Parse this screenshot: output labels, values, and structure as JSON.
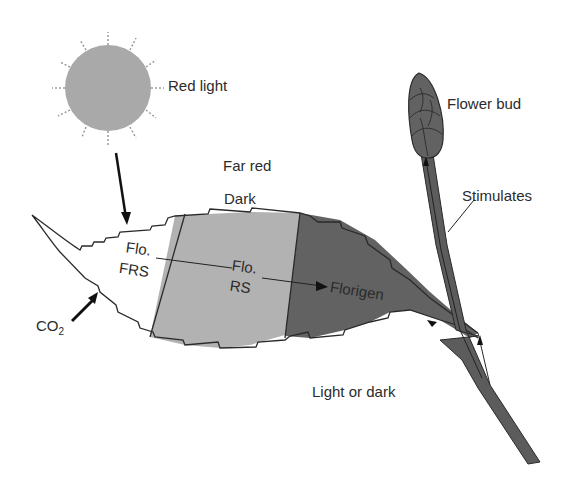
{
  "diagram": {
    "labels": {
      "red_light": "Red light",
      "far_red": "Far red",
      "dark": "Dark",
      "flo_frs_line1": "Flo.",
      "flo_frs_line2": "FRS",
      "flo_rs_line1": "Flo.",
      "flo_rs_line2": "RS",
      "florigen": "Florigen",
      "light_or_dark": "Light or dark",
      "flower_bud": "Flower bud",
      "stimulates": "Stimulates",
      "co2": "CO",
      "co2_sub": "2"
    },
    "colors": {
      "sun": "#a9a9a9",
      "light_region": "#b2b2b2",
      "dark_region": "#626262",
      "stem": "#5c5c5c",
      "outline": "#2a2a2a"
    }
  }
}
